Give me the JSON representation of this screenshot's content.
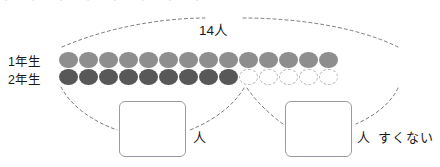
{
  "top_clip_text": "・ ・ ・ ・ ・ ・ ・ ・",
  "rows": [
    {
      "label": "1年生",
      "name": "first-grade",
      "total": 14,
      "filled": 14,
      "empty": 0,
      "color": "#8e8e8e"
    },
    {
      "label": "2年生",
      "name": "second-grade",
      "total": 14,
      "filled": 9,
      "empty": 5,
      "color": "#585858"
    }
  ],
  "bracket": {
    "total_label": "14人"
  },
  "answers": [
    {
      "name": "left-answer",
      "value": "",
      "unit": "人"
    },
    {
      "name": "right-answer",
      "value": "",
      "unit": "人"
    }
  ],
  "less_label": "すくない",
  "colors": {
    "row1_dot": "#8e8e8e",
    "row2_dot": "#585858",
    "empty_dot_border": "#b9b9b9",
    "box_border": "#9a9aa2",
    "dash_line": "#7b7b7b",
    "text": "#1a1a1a",
    "background": "#ffffff"
  },
  "chart_data": {
    "type": "bar",
    "title": "14人",
    "categories": [
      "1年生",
      "2年生"
    ],
    "values": [
      14,
      9
    ],
    "xlabel": "",
    "ylabel": "人数",
    "ylim": [
      0,
      14
    ],
    "grid": false,
    "legend": false,
    "annotations": [
      {
        "text": "14人",
        "target": "1年生",
        "value": 14
      },
      {
        "text": "人",
        "target": "2年生-filled",
        "value": 9
      },
      {
        "text": "人 すくない",
        "target": "difference",
        "value": 5
      }
    ]
  }
}
